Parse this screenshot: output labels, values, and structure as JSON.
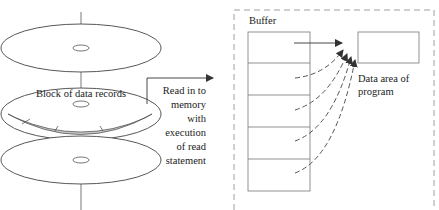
{
  "diagram": {
    "disk": {
      "block_label": "Block of data records",
      "platters": 3
    },
    "transfer_label": [
      "Read in to",
      "memory",
      "with",
      "execution",
      "of read",
      "statement"
    ],
    "buffer": {
      "title": "Buffer",
      "slots": 5
    },
    "program_area": {
      "label": [
        "Data area of",
        "program"
      ]
    },
    "colors": {
      "line": "#555555",
      "dash": "#999999",
      "block_fill": "#c8c8c8",
      "text": "#222222"
    }
  }
}
